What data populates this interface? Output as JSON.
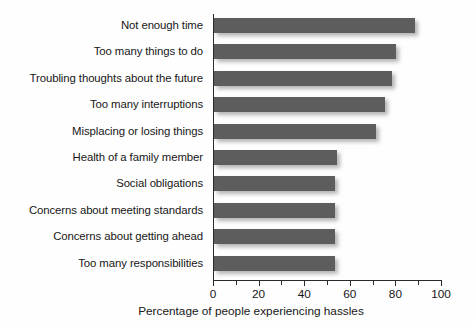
{
  "chart_data": {
    "type": "bar",
    "orientation": "horizontal",
    "title": "",
    "xlabel": "Percentage of people experiencing hassles",
    "ylabel": "",
    "xlim": [
      0,
      100
    ],
    "grid": false,
    "legend": null,
    "xticks": [
      0,
      20,
      40,
      60,
      80,
      100
    ],
    "xtick_labels": [
      "0",
      "20",
      "40",
      "60",
      "80",
      "100"
    ],
    "minor_xticks": [
      10,
      30,
      50,
      70,
      90
    ],
    "bar_color": "#5d5d5d",
    "axis_color": "#2b2b2b",
    "background_color": "#fefefe",
    "categories": [
      "Not enough time",
      "Too many things to do",
      "Troubling thoughts about the future",
      "Too many interruptions",
      "Misplacing or losing things",
      "Health of a family member",
      "Social obligations",
      "Concerns about meeting standards",
      "Concerns about getting ahead",
      "Too many responsibilities"
    ],
    "values": [
      88,
      80,
      78,
      75,
      71,
      54,
      53,
      53,
      53,
      53
    ]
  }
}
